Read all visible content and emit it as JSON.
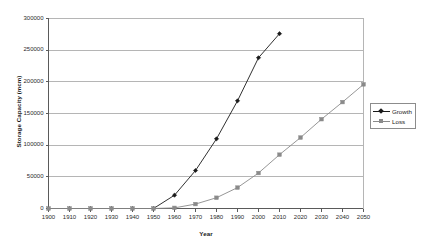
{
  "chart_data": {
    "type": "line",
    "title": "",
    "xlabel": "Year",
    "ylabel": "Storage Capacity (mcm)",
    "x": [
      1900,
      1910,
      1920,
      1930,
      1940,
      1950,
      1960,
      1970,
      1980,
      1990,
      2000,
      2010,
      2020,
      2030,
      2040,
      2050
    ],
    "xlim": [
      1900,
      2050
    ],
    "ylim": [
      0,
      300000
    ],
    "xticks": [
      "1900",
      "1910",
      "1920",
      "1930",
      "1940",
      "1950",
      "1960",
      "1970",
      "1980",
      "1990",
      "2000",
      "2010",
      "2020",
      "2030",
      "2040",
      "2050"
    ],
    "yticks": [
      "0",
      "50000",
      "100000",
      "150000",
      "200000",
      "250000",
      "300000"
    ],
    "ytick_values": [
      0,
      50000,
      100000,
      150000,
      200000,
      250000,
      300000
    ],
    "grid": "horizontal",
    "legend_position": "right",
    "series": [
      {
        "name": "Growth",
        "color": "#1a1a1a",
        "marker": "diamond",
        "values": [
          0,
          0,
          0,
          0,
          0,
          0,
          21000,
          60000,
          110000,
          170000,
          238000,
          276000,
          null,
          null,
          null,
          null
        ]
      },
      {
        "name": "Loss",
        "color": "#8a8a8a",
        "marker": "square",
        "values": [
          0,
          0,
          0,
          0,
          0,
          0,
          1000,
          7000,
          17000,
          33000,
          56000,
          85000,
          112000,
          141000,
          168000,
          196000
        ]
      }
    ]
  },
  "axes": {
    "y_title": "Storage Capacity (mcm)",
    "x_title": "Year"
  },
  "legend": {
    "items": [
      {
        "label": "Growth",
        "color": "#1a1a1a",
        "marker": "diamond"
      },
      {
        "label": "Loss",
        "color": "#8a8a8a",
        "marker": "square"
      }
    ]
  }
}
